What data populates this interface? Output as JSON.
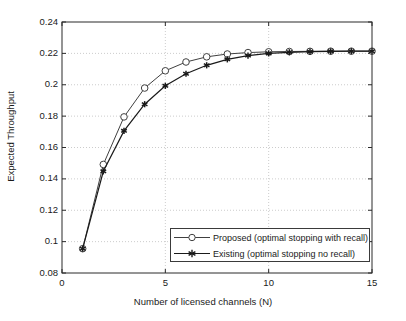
{
  "chart_data": {
    "type": "line",
    "title": "",
    "xlabel": "Number of licensed channels (N)",
    "ylabel": "Expected Throughput",
    "xlim": [
      0,
      15
    ],
    "ylim": [
      0.08,
      0.24
    ],
    "xticks": [
      0,
      5,
      10,
      15
    ],
    "yticks": [
      0.08,
      0.1,
      0.12,
      0.14,
      0.16,
      0.18,
      0.2,
      0.22,
      0.24
    ],
    "xtick_labels": [
      "0",
      "5",
      "10",
      "15"
    ],
    "ytick_labels": [
      "0.08",
      "0.1",
      "0.12",
      "0.14",
      "0.16",
      "0.18",
      "0.2",
      "0.22",
      "0.24"
    ],
    "grid": true,
    "grid_style": "dotted",
    "legend_position": "lower right",
    "x": [
      1,
      2,
      3,
      4,
      5,
      6,
      7,
      8,
      9,
      10,
      11,
      12,
      13,
      14,
      15
    ],
    "series": [
      {
        "name": "Proposed (optimal stopping with recall)",
        "marker": "circle-open",
        "color": "#404040",
        "values": [
          0.0955,
          0.1492,
          0.1795,
          0.1979,
          0.2089,
          0.2145,
          0.2178,
          0.2196,
          0.2205,
          0.221,
          0.2212,
          0.2213,
          0.2214,
          0.2214,
          0.2214
        ]
      },
      {
        "name": "Existing (optimal stopping no recall)",
        "marker": "star-filled",
        "color": "#1a1a1a",
        "values": [
          0.0955,
          0.1448,
          0.1706,
          0.1876,
          0.1993,
          0.207,
          0.2124,
          0.2162,
          0.2186,
          0.22,
          0.2207,
          0.2211,
          0.2213,
          0.2214,
          0.2214
        ]
      }
    ]
  },
  "legend": {
    "items": [
      {
        "label": "Proposed (optimal stopping with recall)"
      },
      {
        "label": "Existing (optimal stopping no recall)"
      }
    ]
  },
  "colors": {
    "axis": "#2b2b2b",
    "grid": "#bfbfbf",
    "background": "#ffffff",
    "series_proposed": "#404040",
    "series_existing": "#1a1a1a"
  }
}
